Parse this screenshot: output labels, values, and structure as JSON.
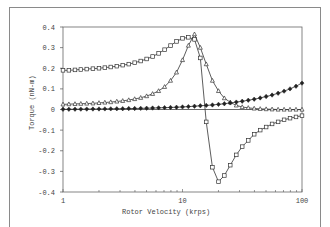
{
  "chart_data": {
    "type": "line",
    "title": "",
    "xlabel": "Rotor Velocity   (krps)",
    "ylabel": "Torque   (nN-m)",
    "xscale": "log",
    "xlim": [
      1,
      100
    ],
    "ylim": [
      -0.4,
      0.4
    ],
    "x_ticks": [
      "1",
      "10",
      "100"
    ],
    "y_ticks": [
      "0.4",
      "0.3",
      "0.2",
      "0.1",
      "0",
      "-0.1",
      "-0.2",
      "-0.3",
      "-0.4"
    ],
    "grid": false,
    "legend": null,
    "series": [
      {
        "name": "square-marker series",
        "marker": "open-square",
        "x": [
          1,
          1.12,
          1.26,
          1.41,
          1.58,
          1.78,
          2.0,
          2.24,
          2.51,
          2.82,
          3.16,
          3.55,
          3.98,
          4.47,
          5.01,
          5.62,
          6.31,
          7.08,
          7.94,
          8.91,
          10.0,
          11.2,
          12.6,
          14.1,
          15.8,
          17.8,
          20.0,
          22.4,
          25.1,
          28.2,
          31.6,
          35.5,
          39.8,
          44.7,
          50.1,
          56.2,
          63.1,
          70.8,
          79.4,
          89.1,
          100
        ],
        "y": [
          0.19,
          0.19,
          0.192,
          0.194,
          0.196,
          0.198,
          0.2,
          0.203,
          0.206,
          0.21,
          0.215,
          0.22,
          0.227,
          0.235,
          0.245,
          0.257,
          0.272,
          0.29,
          0.31,
          0.33,
          0.345,
          0.35,
          0.34,
          0.25,
          -0.06,
          -0.28,
          -0.35,
          -0.32,
          -0.27,
          -0.22,
          -0.18,
          -0.15,
          -0.12,
          -0.1,
          -0.085,
          -0.07,
          -0.06,
          -0.05,
          -0.042,
          -0.036,
          -0.03
        ]
      },
      {
        "name": "triangle-marker series",
        "marker": "open-triangle",
        "x": [
          1,
          1.12,
          1.26,
          1.41,
          1.58,
          1.78,
          2.0,
          2.24,
          2.51,
          2.82,
          3.16,
          3.55,
          3.98,
          4.47,
          5.01,
          5.62,
          6.31,
          7.08,
          7.94,
          8.91,
          10.0,
          11.2,
          12.6,
          14.1,
          15.8,
          17.8,
          20.0,
          22.4,
          25.1,
          28.2,
          31.6,
          35.5,
          39.8,
          44.7,
          50.1,
          56.2,
          63.1,
          70.8,
          79.4,
          89.1,
          100
        ],
        "y": [
          0.025,
          0.026,
          0.027,
          0.028,
          0.029,
          0.03,
          0.032,
          0.034,
          0.036,
          0.039,
          0.042,
          0.046,
          0.051,
          0.057,
          0.065,
          0.076,
          0.09,
          0.11,
          0.14,
          0.18,
          0.24,
          0.31,
          0.365,
          0.3,
          0.22,
          0.14,
          0.09,
          0.055,
          0.035,
          0.02,
          0.012,
          0.008,
          0.005,
          0.003,
          0.002,
          0.001,
          0.0,
          0.0,
          0.0,
          0.0,
          0.0
        ]
      },
      {
        "name": "diamond-marker series",
        "marker": "filled-diamond",
        "x": [
          1,
          1.12,
          1.26,
          1.41,
          1.58,
          1.78,
          2.0,
          2.24,
          2.51,
          2.82,
          3.16,
          3.55,
          3.98,
          4.47,
          5.01,
          5.62,
          6.31,
          7.08,
          7.94,
          8.91,
          10.0,
          11.2,
          12.6,
          14.1,
          15.8,
          17.8,
          20.0,
          22.4,
          25.1,
          28.2,
          31.6,
          35.5,
          39.8,
          44.7,
          50.1,
          56.2,
          63.1,
          70.8,
          79.4,
          89.1,
          100
        ],
        "y": [
          0.001,
          0.001,
          0.0015,
          0.0017,
          0.002,
          0.0022,
          0.0025,
          0.0028,
          0.0032,
          0.0036,
          0.004,
          0.0045,
          0.005,
          0.0056,
          0.0063,
          0.007,
          0.008,
          0.009,
          0.01,
          0.011,
          0.0125,
          0.014,
          0.016,
          0.018,
          0.02,
          0.022,
          0.025,
          0.028,
          0.032,
          0.036,
          0.04,
          0.045,
          0.05,
          0.056,
          0.063,
          0.07,
          0.079,
          0.089,
          0.1,
          0.113,
          0.128
        ]
      }
    ]
  },
  "axes": {
    "x_title": "Rotor Velocity   (krps)",
    "y_title": "Torque   (nN-m)"
  }
}
